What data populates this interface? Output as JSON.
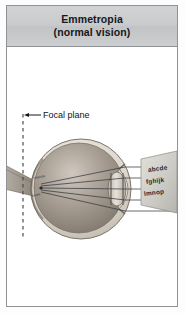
{
  "figure": {
    "title_line_1": "Emmetropia",
    "title_line_2": "(normal vision)",
    "focal_plane_label": "Focal plane",
    "eye_annotations": [
      "macula",
      "fovea"
    ],
    "eye_chart": {
      "rows": [
        "abcde",
        "fghijk",
        "lmnop"
      ]
    },
    "colors": {
      "header_background": "#c9cacb",
      "frame_border": "#8f9296",
      "page_background": "#ffffff",
      "title_text": "#15181c",
      "eye_sclera": "#d6cfc6",
      "eye_interior": "#9a9086",
      "eye_lens": "#cfcac2",
      "ray_line": "#3a3f46",
      "focal_plane_line": "#4a4d52",
      "chart_card": "#cfcdc8"
    },
    "ray_count": 5
  }
}
